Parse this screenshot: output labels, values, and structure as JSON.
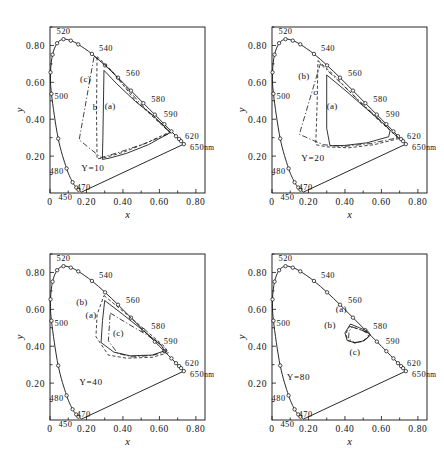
{
  "figure": {
    "panel_count": 4
  },
  "axes": {
    "x_title": "x",
    "y_title": "y",
    "x_ticks": [
      "0",
      "0.20",
      "0.40",
      "0.60",
      "0.80"
    ],
    "y_ticks": [
      "0.20",
      "0.40",
      "0.60",
      "0.80"
    ],
    "x_tick_values": [
      0,
      0.2,
      0.4,
      0.6,
      0.8
    ],
    "y_tick_values": [
      0.2,
      0.4,
      0.6,
      0.8
    ],
    "x_range": [
      0,
      0.85
    ],
    "y_range": [
      0,
      0.9
    ]
  },
  "wavelength_labels": [
    "450",
    "470",
    "480",
    "500",
    "520",
    "540",
    "560",
    "580",
    "590",
    "620",
    "650"
  ],
  "nm_suffix": "nm",
  "region_labels": {
    "a": "(a)",
    "b": "(b)",
    "c": "(c)"
  },
  "panels": [
    {
      "id": "panel-y10",
      "luminance_label": "Y=10",
      "luminance_value": 10,
      "position": "top-left",
      "region_a_label": "(a)",
      "region_b_label": "b",
      "region_c_label": "(c)"
    },
    {
      "id": "panel-y20",
      "luminance_label": "Y=20",
      "luminance_value": 20,
      "position": "top-right",
      "region_a_label": "(a)",
      "region_b_label": "(b)",
      "region_c_label": "c"
    },
    {
      "id": "panel-y40",
      "luminance_label": "Y=40",
      "luminance_value": 40,
      "position": "bottom-left",
      "region_a_label": "(a)",
      "region_b_label": "(b)",
      "region_c_label": "(c)"
    },
    {
      "id": "panel-y80",
      "luminance_label": "Y=80",
      "luminance_value": 80,
      "position": "bottom-right",
      "region_a_label": "(a)",
      "region_b_label": "(b)",
      "region_c_label": "(c)"
    }
  ],
  "chart_data": {
    "type": "scatter",
    "xlabel": "x",
    "ylabel": "y",
    "xlim": [
      0,
      0.85
    ],
    "ylim": [
      0,
      0.9
    ],
    "grid": false,
    "legend": "inline region labels (a), (b), (c)",
    "spectral_locus": {
      "name": "CIE spectral locus",
      "points": [
        {
          "wl": 400,
          "x": 0.173,
          "y": 0.005
        },
        {
          "wl": 450,
          "x": 0.156,
          "y": 0.018
        },
        {
          "wl": 460,
          "x": 0.144,
          "y": 0.03
        },
        {
          "wl": 470,
          "x": 0.124,
          "y": 0.058
        },
        {
          "wl": 480,
          "x": 0.091,
          "y": 0.133
        },
        {
          "wl": 490,
          "x": 0.045,
          "y": 0.295
        },
        {
          "wl": 500,
          "x": 0.008,
          "y": 0.538
        },
        {
          "wl": 505,
          "x": 0.003,
          "y": 0.654
        },
        {
          "wl": 510,
          "x": 0.014,
          "y": 0.75
        },
        {
          "wl": 515,
          "x": 0.039,
          "y": 0.812
        },
        {
          "wl": 520,
          "x": 0.074,
          "y": 0.834
        },
        {
          "wl": 525,
          "x": 0.114,
          "y": 0.826
        },
        {
          "wl": 530,
          "x": 0.155,
          "y": 0.806
        },
        {
          "wl": 540,
          "x": 0.23,
          "y": 0.754
        },
        {
          "wl": 550,
          "x": 0.302,
          "y": 0.692
        },
        {
          "wl": 560,
          "x": 0.373,
          "y": 0.625
        },
        {
          "wl": 570,
          "x": 0.444,
          "y": 0.555
        },
        {
          "wl": 580,
          "x": 0.512,
          "y": 0.487
        },
        {
          "wl": 590,
          "x": 0.575,
          "y": 0.425
        },
        {
          "wl": 600,
          "x": 0.627,
          "y": 0.373
        },
        {
          "wl": 610,
          "x": 0.666,
          "y": 0.334
        },
        {
          "wl": 620,
          "x": 0.691,
          "y": 0.308
        },
        {
          "wl": 630,
          "x": 0.708,
          "y": 0.292
        },
        {
          "wl": 650,
          "x": 0.719,
          "y": 0.281
        },
        {
          "wl": 700,
          "x": 0.734,
          "y": 0.265
        }
      ]
    },
    "purple_line": {
      "from": {
        "x": 0.734,
        "y": 0.265
      },
      "to": {
        "x": 0.173,
        "y": 0.005
      }
    },
    "series": [
      {
        "name": "(a)",
        "panel": "Y=10",
        "line": "solid",
        "vertices": [
          {
            "x": 0.296,
            "y": 0.665
          },
          {
            "x": 0.365,
            "y": 0.593
          },
          {
            "x": 0.47,
            "y": 0.495
          },
          {
            "x": 0.56,
            "y": 0.425
          },
          {
            "x": 0.64,
            "y": 0.35
          },
          {
            "x": 0.66,
            "y": 0.328
          },
          {
            "x": 0.54,
            "y": 0.262
          },
          {
            "x": 0.42,
            "y": 0.215
          },
          {
            "x": 0.33,
            "y": 0.19
          },
          {
            "x": 0.287,
            "y": 0.182
          },
          {
            "x": 0.29,
            "y": 0.3
          },
          {
            "x": 0.296,
            "y": 0.665
          }
        ]
      },
      {
        "name": "(b)",
        "panel": "Y=10",
        "line": "dashed",
        "vertices": [
          {
            "x": 0.258,
            "y": 0.74
          },
          {
            "x": 0.33,
            "y": 0.672
          },
          {
            "x": 0.47,
            "y": 0.5
          },
          {
            "x": 0.62,
            "y": 0.362
          },
          {
            "x": 0.655,
            "y": 0.33
          },
          {
            "x": 0.53,
            "y": 0.272
          },
          {
            "x": 0.4,
            "y": 0.22
          },
          {
            "x": 0.3,
            "y": 0.192
          },
          {
            "x": 0.258,
            "y": 0.185
          },
          {
            "x": 0.255,
            "y": 0.43
          },
          {
            "x": 0.258,
            "y": 0.74
          }
        ]
      },
      {
        "name": "(c)",
        "panel": "Y=10",
        "line": "dash-dot",
        "vertices": [
          {
            "x": 0.242,
            "y": 0.742
          },
          {
            "x": 0.34,
            "y": 0.66
          },
          {
            "x": 0.5,
            "y": 0.48
          },
          {
            "x": 0.64,
            "y": 0.345
          },
          {
            "x": 0.66,
            "y": 0.325
          },
          {
            "x": 0.52,
            "y": 0.268
          },
          {
            "x": 0.37,
            "y": 0.218
          },
          {
            "x": 0.28,
            "y": 0.192
          },
          {
            "x": 0.16,
            "y": 0.288
          },
          {
            "x": 0.242,
            "y": 0.742
          }
        ]
      },
      {
        "name": "(a)",
        "panel": "Y=20",
        "line": "solid",
        "vertices": [
          {
            "x": 0.3,
            "y": 0.64
          },
          {
            "x": 0.4,
            "y": 0.558
          },
          {
            "x": 0.52,
            "y": 0.455
          },
          {
            "x": 0.62,
            "y": 0.368
          },
          {
            "x": 0.648,
            "y": 0.34
          },
          {
            "x": 0.64,
            "y": 0.305
          },
          {
            "x": 0.52,
            "y": 0.272
          },
          {
            "x": 0.4,
            "y": 0.258
          },
          {
            "x": 0.318,
            "y": 0.256
          },
          {
            "x": 0.3,
            "y": 0.35
          },
          {
            "x": 0.3,
            "y": 0.64
          }
        ]
      },
      {
        "name": "(b)",
        "panel": "Y=20",
        "line": "dashed",
        "vertices": [
          {
            "x": 0.252,
            "y": 0.718
          },
          {
            "x": 0.33,
            "y": 0.648
          },
          {
            "x": 0.47,
            "y": 0.505
          },
          {
            "x": 0.6,
            "y": 0.38
          },
          {
            "x": 0.7,
            "y": 0.296
          },
          {
            "x": 0.56,
            "y": 0.262
          },
          {
            "x": 0.42,
            "y": 0.245
          },
          {
            "x": 0.3,
            "y": 0.25
          },
          {
            "x": 0.24,
            "y": 0.262
          },
          {
            "x": 0.248,
            "y": 0.5
          },
          {
            "x": 0.252,
            "y": 0.718
          }
        ]
      },
      {
        "name": "(c)",
        "panel": "Y=20",
        "line": "dash-dot",
        "vertices": [
          {
            "x": 0.265,
            "y": 0.7
          },
          {
            "x": 0.36,
            "y": 0.612
          },
          {
            "x": 0.5,
            "y": 0.48
          },
          {
            "x": 0.62,
            "y": 0.37
          },
          {
            "x": 0.69,
            "y": 0.3
          },
          {
            "x": 0.54,
            "y": 0.268
          },
          {
            "x": 0.39,
            "y": 0.252
          },
          {
            "x": 0.28,
            "y": 0.262
          },
          {
            "x": 0.15,
            "y": 0.318
          },
          {
            "x": 0.265,
            "y": 0.7
          }
        ]
      },
      {
        "name": "(a)",
        "panel": "Y=40",
        "line": "solid",
        "vertices": [
          {
            "x": 0.3,
            "y": 0.648
          },
          {
            "x": 0.4,
            "y": 0.572
          },
          {
            "x": 0.52,
            "y": 0.478
          },
          {
            "x": 0.61,
            "y": 0.405
          },
          {
            "x": 0.628,
            "y": 0.375
          },
          {
            "x": 0.56,
            "y": 0.352
          },
          {
            "x": 0.44,
            "y": 0.348
          },
          {
            "x": 0.35,
            "y": 0.368
          },
          {
            "x": 0.28,
            "y": 0.42
          },
          {
            "x": 0.288,
            "y": 0.54
          },
          {
            "x": 0.3,
            "y": 0.648
          }
        ]
      },
      {
        "name": "(b)",
        "panel": "Y=40",
        "line": "dashed",
        "vertices": [
          {
            "x": 0.296,
            "y": 0.675
          },
          {
            "x": 0.4,
            "y": 0.59
          },
          {
            "x": 0.53,
            "y": 0.482
          },
          {
            "x": 0.628,
            "y": 0.398
          },
          {
            "x": 0.65,
            "y": 0.365
          },
          {
            "x": 0.56,
            "y": 0.34
          },
          {
            "x": 0.42,
            "y": 0.335
          },
          {
            "x": 0.32,
            "y": 0.352
          },
          {
            "x": 0.252,
            "y": 0.452
          },
          {
            "x": 0.258,
            "y": 0.57
          },
          {
            "x": 0.296,
            "y": 0.675
          }
        ]
      },
      {
        "name": "(c)",
        "panel": "Y=40",
        "line": "dash-dot",
        "vertices": [
          {
            "x": 0.33,
            "y": 0.58
          },
          {
            "x": 0.43,
            "y": 0.52
          },
          {
            "x": 0.53,
            "y": 0.462
          },
          {
            "x": 0.62,
            "y": 0.4
          },
          {
            "x": 0.64,
            "y": 0.372
          },
          {
            "x": 0.56,
            "y": 0.35
          },
          {
            "x": 0.45,
            "y": 0.342
          },
          {
            "x": 0.37,
            "y": 0.362
          },
          {
            "x": 0.32,
            "y": 0.43
          },
          {
            "x": 0.33,
            "y": 0.58
          }
        ]
      },
      {
        "name": "(a)",
        "panel": "Y=80",
        "line": "solid",
        "vertices": [
          {
            "x": 0.43,
            "y": 0.52
          },
          {
            "x": 0.48,
            "y": 0.5
          },
          {
            "x": 0.528,
            "y": 0.48
          },
          {
            "x": 0.54,
            "y": 0.46
          },
          {
            "x": 0.505,
            "y": 0.43
          },
          {
            "x": 0.455,
            "y": 0.418
          },
          {
            "x": 0.412,
            "y": 0.432
          },
          {
            "x": 0.4,
            "y": 0.472
          },
          {
            "x": 0.43,
            "y": 0.52
          }
        ]
      },
      {
        "name": "(b)",
        "panel": "Y=80",
        "line": "dashed",
        "vertices": [
          {
            "x": 0.425,
            "y": 0.508
          },
          {
            "x": 0.478,
            "y": 0.492
          },
          {
            "x": 0.52,
            "y": 0.476
          },
          {
            "x": 0.532,
            "y": 0.456
          },
          {
            "x": 0.498,
            "y": 0.428
          },
          {
            "x": 0.452,
            "y": 0.418
          },
          {
            "x": 0.415,
            "y": 0.432
          },
          {
            "x": 0.405,
            "y": 0.468
          },
          {
            "x": 0.425,
            "y": 0.508
          }
        ]
      },
      {
        "name": "(c)",
        "panel": "Y=80",
        "line": "dash-dot",
        "vertices": [
          {
            "x": 0.438,
            "y": 0.505
          },
          {
            "x": 0.49,
            "y": 0.488
          },
          {
            "x": 0.525,
            "y": 0.47
          },
          {
            "x": 0.53,
            "y": 0.45
          },
          {
            "x": 0.495,
            "y": 0.425
          },
          {
            "x": 0.452,
            "y": 0.42
          },
          {
            "x": 0.42,
            "y": 0.44
          },
          {
            "x": 0.422,
            "y": 0.478
          },
          {
            "x": 0.438,
            "y": 0.505
          }
        ]
      }
    ]
  }
}
